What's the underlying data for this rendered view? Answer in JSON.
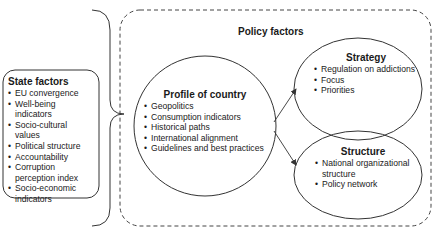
{
  "state_factors": {
    "title": "State factors",
    "items": [
      "EU convergence",
      "Well-being",
      "indicators",
      "Socio-cultural",
      "values",
      "Political structure",
      "Accountability",
      "Corruption",
      "perception index",
      "Socio-economic",
      "indicators"
    ]
  },
  "policy_factors": {
    "title": "Policy factors"
  },
  "profile": {
    "title": "Profile of country",
    "items": [
      "Geopolitics",
      "Consumption indicators",
      "Historical paths",
      "International alignment",
      "Guidelines and best practices"
    ]
  },
  "strategy": {
    "title": "Strategy",
    "items": [
      "Regulation on addictions",
      "Focus",
      "Priorities"
    ]
  },
  "structure": {
    "title": "Structure",
    "items": [
      "National organizational",
      "structure",
      "Policy network"
    ]
  },
  "colors": {
    "stroke": "#333333",
    "text": "#1a1a1a",
    "background": "#ffffff"
  }
}
